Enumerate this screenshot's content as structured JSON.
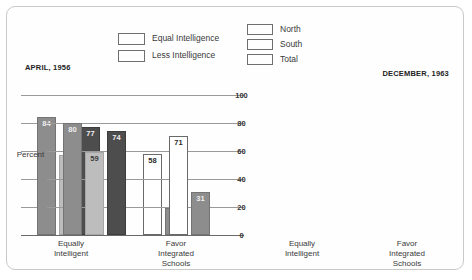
{
  "chart_data": {
    "type": "bar",
    "title": "",
    "ylabel": "Percent",
    "xlabel": "",
    "ylim": [
      0,
      100
    ],
    "yticks": [
      100,
      80,
      60,
      40,
      20,
      0
    ],
    "grid": true,
    "legend_position": "top",
    "categories": [
      "Equally Intelligent",
      "Favor Integrated Schools"
    ],
    "panels": [
      {
        "name": "APRIL, 1956",
        "groups": [
          {
            "category": "Equally Intelligent",
            "bars": [
              {
                "series": "North",
                "value": 84,
                "fill": "north"
              },
              {
                "series": "South",
                "value": 57,
                "fill": "south"
              },
              {
                "series": "Total",
                "value": 77,
                "fill": "total"
              }
            ]
          },
          {
            "category": "Favor Integrated Schools",
            "bars": [
              {
                "series": "North",
                "value": 58,
                "fill": "open"
              },
              {
                "series": "South",
                "value": 19,
                "fill": "north"
              }
            ]
          }
        ]
      },
      {
        "name": "DECEMBER, 1963",
        "groups": [
          {
            "category": "Equally Intelligent",
            "bars": [
              {
                "series": "North",
                "value": 80,
                "fill": "north"
              },
              {
                "series": "South",
                "value": 59,
                "fill": "south"
              },
              {
                "series": "Total",
                "value": 74,
                "fill": "total"
              }
            ]
          },
          {
            "category": "Favor Integrated Schools",
            "bars": [
              {
                "series": "North",
                "value": 71,
                "fill": "open"
              },
              {
                "series": "South",
                "value": 31,
                "fill": "north"
              }
            ]
          }
        ]
      }
    ],
    "legends": [
      {
        "id": "fill",
        "entries": [
          {
            "label": "Equal Intelligence",
            "fill": "open",
            "color": "#ffffff"
          },
          {
            "label": "Less Intelligence",
            "fill": "north",
            "color": "#8d8d8d"
          }
        ]
      },
      {
        "id": "region",
        "entries": [
          {
            "label": "North",
            "fill": "north",
            "color": "#8d8d8d"
          },
          {
            "label": "South",
            "fill": "south",
            "color": "#bdbdbd"
          },
          {
            "label": "Total",
            "fill": "total",
            "color": "#4d4d4d"
          }
        ]
      }
    ]
  },
  "eras": {
    "left": "APRIL, 1956",
    "right": "DECEMBER, 1963"
  },
  "axis": {
    "unit_label": "Percent",
    "ticks": [
      "100",
      "80",
      "60",
      "40",
      "20",
      "0"
    ]
  },
  "group_captions": {
    "equally_intelligent": [
      "Equally",
      "Intelligent"
    ],
    "favor_integrated": [
      "Favor",
      "Integrated",
      "Schools"
    ]
  }
}
